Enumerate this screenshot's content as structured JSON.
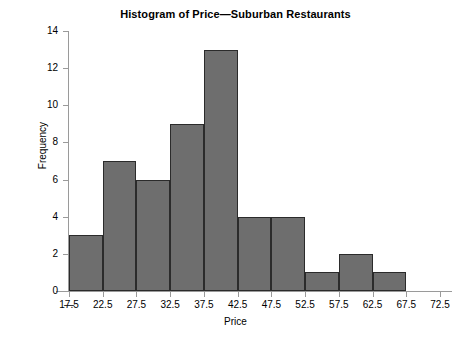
{
  "chart_data": {
    "type": "bar",
    "title": "Histogram of Price—Suburban Restaurants",
    "xlabel": "Price",
    "ylabel": "Frequency",
    "grid": false,
    "legend": null,
    "ylim": [
      0,
      14
    ],
    "yticks": [
      0,
      2,
      4,
      6,
      8,
      10,
      12,
      14
    ],
    "ytick_labels": [
      "0",
      "2",
      "4",
      "6",
      "8",
      "10",
      "12",
      "14"
    ],
    "xlim": [
      17.5,
      72.5
    ],
    "xticks": [
      17.5,
      22.5,
      27.5,
      32.5,
      37.5,
      42.5,
      47.5,
      52.5,
      57.5,
      62.5,
      67.5,
      72.5
    ],
    "xtick_labels": [
      "17.5",
      "22.5",
      "27.5",
      "32.5",
      "37.5",
      "42.5",
      "47.5",
      "52.5",
      "57.5",
      "62.5",
      "67.5",
      "72.5"
    ],
    "axis_break_symbol": "—",
    "bin_width": 5,
    "bin_edges": [
      17.5,
      22.5,
      27.5,
      32.5,
      37.5,
      42.5,
      47.5,
      52.5,
      57.5,
      62.5,
      67.5,
      72.5
    ],
    "bin_labels": [
      "17.5–22.5",
      "22.5–27.5",
      "27.5–32.5",
      "32.5–37.5",
      "37.5–42.5",
      "42.5–47.5",
      "47.5–52.5",
      "52.5–57.5",
      "57.5–62.5",
      "62.5–67.5",
      "67.5–72.5"
    ],
    "values": [
      3,
      7,
      6,
      9,
      13,
      4,
      4,
      1,
      2,
      1
    ],
    "bar_fill_color": "#6e6e6e",
    "bar_edge_color": "#2b2b2b",
    "axis_color": "#9a9a9a",
    "background_color": "#ffffff"
  }
}
